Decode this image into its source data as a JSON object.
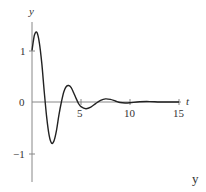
{
  "chart_data": {
    "type": "line",
    "title": "",
    "xlabel": "t",
    "ylabel": "y",
    "corner_label": "y",
    "xlim": [
      0,
      15
    ],
    "ylim": [
      -1.5,
      1.5
    ],
    "xticks": [
      5,
      10,
      15
    ],
    "yticks": [
      -1,
      0,
      1
    ],
    "grid": false,
    "legend": null,
    "series": [
      {
        "name": "y(t)",
        "x": [
          0,
          0.25,
          0.5,
          0.75,
          1.0,
          1.25,
          1.5,
          1.75,
          2.0,
          2.25,
          2.5,
          2.75,
          3.0,
          3.25,
          3.5,
          3.75,
          4.0,
          4.25,
          4.5,
          4.75,
          5.0,
          5.5,
          6.0,
          6.5,
          7.0,
          7.5,
          8.0,
          8.5,
          9.0,
          9.5,
          10.0,
          11.0,
          12.0,
          13.0,
          14.0,
          15.0
        ],
        "values": [
          1.0,
          1.3,
          1.35,
          1.15,
          0.75,
          0.2,
          -0.3,
          -0.65,
          -0.8,
          -0.75,
          -0.55,
          -0.25,
          0.0,
          0.2,
          0.3,
          0.32,
          0.28,
          0.18,
          0.07,
          -0.03,
          -0.09,
          -0.13,
          -0.1,
          -0.03,
          0.03,
          0.06,
          0.05,
          0.02,
          -0.01,
          -0.02,
          -0.015,
          0.005,
          0.008,
          0.0,
          0.0,
          0.0
        ]
      }
    ]
  },
  "labels": {
    "y_axis": "y",
    "x_axis": "t",
    "x_tick_5": "5",
    "x_tick_10": "10",
    "x_tick_15": "15",
    "y_tick_1": "1",
    "y_tick_0": "0",
    "y_tick_neg1": "−1",
    "corner": "y"
  }
}
